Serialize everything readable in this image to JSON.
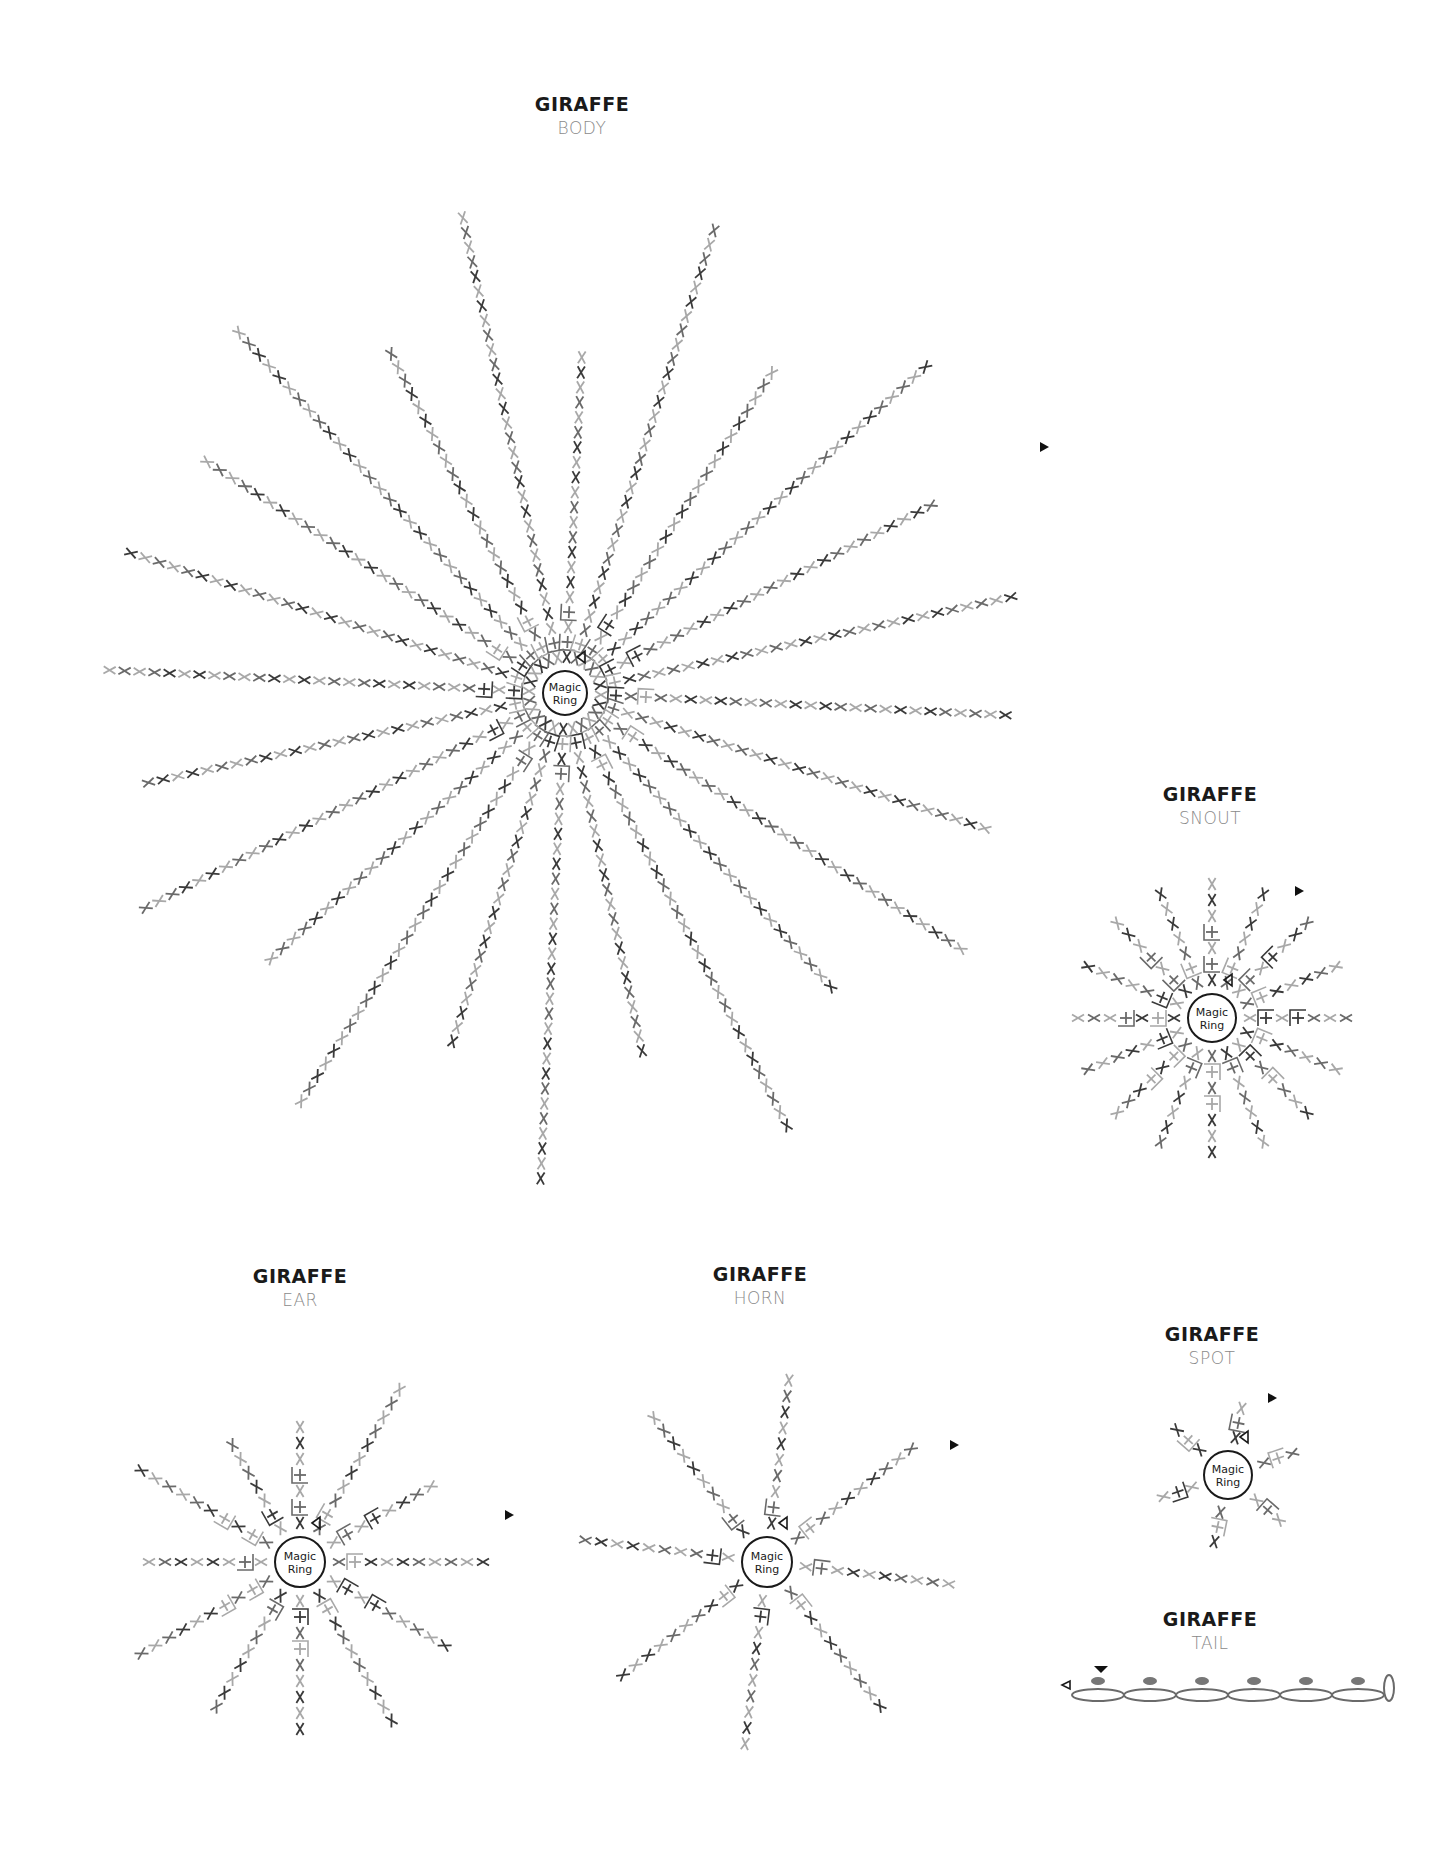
{
  "page": {
    "background": "#ffffff"
  },
  "colors": {
    "dark": "#3a3a3a",
    "mid": "#6a6a6a",
    "light": "#a8a8a8",
    "ring": "#1a1a1a",
    "title": "#1a1a1a",
    "subtitle": "#8a8a8a"
  },
  "legend_symbols": {
    "single_crochet": "×",
    "increase": "V-shaped pair of ×",
    "decrease": "inverted V",
    "front_loop": "+ with corner bracket",
    "start_marker": "▷ (open triangle)",
    "end_marker": "▶ (filled triangle)",
    "chain": "oval",
    "slip_stitch": "filled ellipse",
    "magic_ring": "circle"
  },
  "charts": [
    {
      "id": "body",
      "title": "GIRAFFE",
      "subtitle": "BODY",
      "ring_label_1": "Magic",
      "ring_label_2": "Ring",
      "title_pos": [
        582,
        100
      ],
      "center": [
        565,
        693
      ],
      "ring_radius": 22,
      "spokes": 24,
      "spoke_length": 500,
      "spacing": 15
    },
    {
      "id": "snout",
      "title": "GIRAFFE",
      "subtitle": "SNOUT",
      "ring_label_1": "Magic",
      "ring_label_2": "Ring",
      "title_pos": [
        1210,
        790
      ],
      "center": [
        1212,
        1018
      ],
      "ring_radius": 24,
      "spokes": 16,
      "spoke_length": 150,
      "spacing": 16
    },
    {
      "id": "ear",
      "title": "GIRAFFE",
      "subtitle": "EAR",
      "ring_label_1": "Magic",
      "ring_label_2": "Ring",
      "title_pos": [
        300,
        1272
      ],
      "center": [
        300,
        1562
      ],
      "ring_radius": 25,
      "spokes": 12,
      "spoke_length": 200,
      "spacing": 16
    },
    {
      "id": "horn",
      "title": "GIRAFFE",
      "subtitle": "HORN",
      "ring_label_1": "Magic",
      "ring_label_2": "Ring",
      "title_pos": [
        760,
        1270
      ],
      "center": [
        767,
        1562
      ],
      "ring_radius": 25,
      "spokes": 8,
      "spoke_length": 195,
      "spacing": 16
    },
    {
      "id": "spot",
      "title": "GIRAFFE",
      "subtitle": "SPOT",
      "ring_label_1": "Magic",
      "ring_label_2": "Ring",
      "title_pos": [
        1212,
        1330
      ],
      "center": [
        1228,
        1475
      ],
      "ring_radius": 24,
      "spokes": 6,
      "spoke_length": 70,
      "spacing": 15
    },
    {
      "id": "tail",
      "title": "GIRAFFE",
      "subtitle": "TAIL",
      "title_pos": [
        1210,
        1615
      ],
      "chain_count": 6,
      "chain_start": [
        1072,
        1695
      ],
      "chain_width": 52
    }
  ]
}
